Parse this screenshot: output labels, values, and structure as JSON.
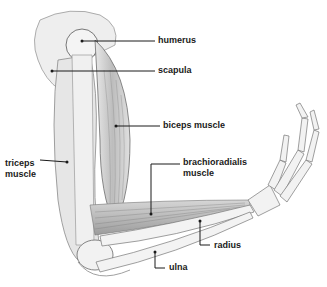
{
  "diagram": {
    "labels": [
      {
        "id": "humerus",
        "text": "humerus"
      },
      {
        "id": "scapula",
        "text": "scapula"
      },
      {
        "id": "biceps",
        "text": "biceps muscle"
      },
      {
        "id": "brachioradialis_1",
        "text": "brachioradialis"
      },
      {
        "id": "brachioradialis_2",
        "text": "muscle"
      },
      {
        "id": "triceps_1",
        "text": "triceps"
      },
      {
        "id": "triceps_2",
        "text": "muscle"
      },
      {
        "id": "radius",
        "text": "radius"
      },
      {
        "id": "ulna",
        "text": "ulna"
      }
    ],
    "colors": {
      "ink": "#1a1a1a",
      "bone": "#f2f2f2",
      "muscle": "#c9c9c9",
      "shade": "#9a9a9a"
    }
  }
}
